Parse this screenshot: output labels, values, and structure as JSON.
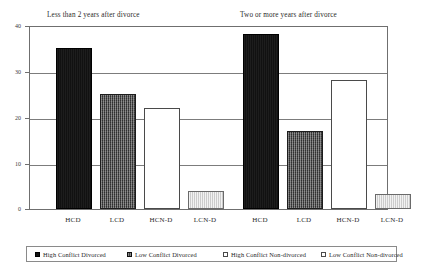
{
  "chart_data": {
    "type": "bar",
    "title": "",
    "xlabel": "",
    "ylabel": "",
    "ylim": [
      0,
      40
    ],
    "yticks": [
      "0",
      "10",
      "20",
      "30",
      "40"
    ],
    "grid": true,
    "legend_position": "bottom",
    "panels": [
      {
        "title": "Less than 2 years after divorce",
        "categories": [
          "HCD",
          "LCD",
          "HCN-D",
          "LCN-D"
        ],
        "values": [
          35,
          25,
          22,
          4
        ]
      },
      {
        "title": "Two or more years after divorce",
        "categories": [
          "HCD",
          "LCD",
          "HCN-D",
          "LCN-D"
        ],
        "values": [
          38,
          17,
          28,
          3.3
        ]
      }
    ],
    "series": [
      {
        "name": "High Conflict Divorced",
        "key": "HCD",
        "fill": "fill-black",
        "swatch": "sw-black",
        "color": "#111111"
      },
      {
        "name": "Low Conflict Divorced",
        "key": "LCD",
        "fill": "fill-darkgrey",
        "swatch": "sw-darkgrey",
        "color": "#474747"
      },
      {
        "name": "High Conflict Non-divorced",
        "key": "HCN-D",
        "fill": "fill-white",
        "swatch": "sw-white",
        "color": "#ffffff"
      },
      {
        "name": "Low Conflict Non-divorced",
        "key": "LCN-D",
        "fill": "fill-lightgrey",
        "swatch": "sw-lightgrey",
        "color": "#e3e3e3"
      }
    ],
    "legend": [
      "High Conflict Divorced",
      "Low Conflict Divorced",
      "High Conflict Non-divorced",
      "Low Conflict Non-divorced"
    ]
  }
}
